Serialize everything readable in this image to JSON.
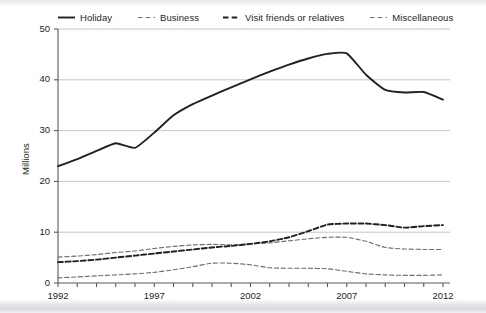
{
  "chart_data": {
    "type": "line",
    "title": "",
    "subtitle": "",
    "xlabel": "",
    "ylabel": "Millions",
    "xlim": [
      1992,
      2012
    ],
    "ylim": [
      0,
      50
    ],
    "grid": "horizontal",
    "legend_position": "top",
    "y_ticks": [
      0,
      10,
      20,
      30,
      40,
      50
    ],
    "y_tick_labels": [
      "0",
      "10",
      "20",
      "30",
      "40",
      "50"
    ],
    "x_ticks": [
      1992,
      1993,
      1994,
      1995,
      1996,
      1997,
      1998,
      1999,
      2000,
      2001,
      2002,
      2003,
      2004,
      2005,
      2006,
      2007,
      2008,
      2009,
      2010,
      2011,
      2012
    ],
    "x_tick_labels": [
      "1992",
      "1997",
      "2002",
      "2007",
      "2012"
    ],
    "x_tick_labelled_years": [
      1992,
      1997,
      2002,
      2007,
      2012
    ],
    "x": [
      1992,
      1993,
      1994,
      1995,
      1996,
      1997,
      1998,
      1999,
      2000,
      2001,
      2002,
      2003,
      2004,
      2005,
      2006,
      2007,
      2008,
      2009,
      2010,
      2011,
      2012
    ],
    "series": [
      {
        "name": "Holiday",
        "style": "solid",
        "color": "#231f20",
        "width": 1.9,
        "values": [
          23.0,
          24.4,
          26.0,
          27.5,
          26.6,
          29.6,
          33.0,
          35.2,
          36.9,
          38.5,
          40.1,
          41.6,
          43.0,
          44.2,
          45.1,
          45.2,
          41.0,
          38.0,
          37.5,
          37.6,
          36.1
        ]
      },
      {
        "name": "Business",
        "style": "dashed",
        "color": "#6d6e71",
        "width": 1.1,
        "values": [
          5.1,
          5.3,
          5.6,
          6.0,
          6.3,
          6.8,
          7.2,
          7.5,
          7.6,
          7.5,
          7.7,
          7.9,
          8.3,
          8.7,
          9.0,
          9.0,
          8.2,
          7.0,
          6.7,
          6.6,
          6.6
        ]
      },
      {
        "name": "Visit friends or relatives",
        "style": "dashed",
        "color": "#231f20",
        "width": 1.9,
        "values": [
          4.1,
          4.3,
          4.6,
          5.0,
          5.4,
          5.8,
          6.2,
          6.6,
          7.0,
          7.3,
          7.7,
          8.2,
          9.0,
          10.2,
          11.5,
          11.7,
          11.7,
          11.4,
          10.9,
          11.2,
          11.4
        ]
      },
      {
        "name": "Miscellaneous",
        "style": "dashed",
        "color": "#6d6e71",
        "width": 1.1,
        "values": [
          1.0,
          1.2,
          1.4,
          1.6,
          1.8,
          2.1,
          2.6,
          3.2,
          3.9,
          3.9,
          3.6,
          3.0,
          2.9,
          2.9,
          2.8,
          2.3,
          1.8,
          1.6,
          1.5,
          1.5,
          1.6
        ]
      }
    ]
  },
  "legend": {
    "items": [
      {
        "label": "Holiday",
        "icon": "solid-line-swatch"
      },
      {
        "label": "Business",
        "icon": "dashed-line-swatch"
      },
      {
        "label": "Visit friends or relatives",
        "icon": "bold-dashed-line-swatch"
      },
      {
        "label": "Miscellaneous",
        "icon": "dashed-line-swatch"
      }
    ]
  }
}
